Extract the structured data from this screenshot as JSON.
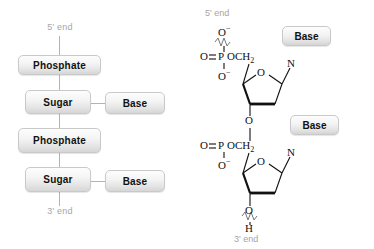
{
  "figure": {
    "background": "#ffffff",
    "box_border": "#c9c9c9",
    "line_color": "#b3b3b3",
    "bond_color": "#111111",
    "label_gray": "#a6a6a6"
  },
  "schematic": {
    "top_end_label": "5' end",
    "bottom_end_label": "3' end",
    "backbone": [
      {
        "label": "Phosphate"
      },
      {
        "label": "Sugar"
      },
      {
        "label": "Phosphate"
      },
      {
        "label": "Sugar"
      }
    ],
    "side_groups": [
      {
        "label": "Base"
      },
      {
        "label": "Base"
      }
    ]
  },
  "structure": {
    "top_end_label": "5' end",
    "bottom_end_label": "3' end",
    "nucleotide_1": {
      "base_label": "Base",
      "phosphate": {
        "o_minus_top": "O",
        "o_minus_top_charge": "−",
        "double_bond_o": "O",
        "p": "P",
        "och2": "OCH",
        "och2_sub": "2",
        "o_minus_bottom": "O",
        "o_minus_bottom_charge": "−"
      },
      "ring_oxygen": "O",
      "glycosidic_n": "N",
      "three_prime_o": "O"
    },
    "nucleotide_2": {
      "base_label": "Base",
      "phosphate": {
        "double_bond_o": "O",
        "p": "P",
        "och2": "OCH",
        "och2_sub": "2",
        "o_minus_bottom": "O",
        "o_minus_bottom_charge": "−"
      },
      "ring_oxygen": "O",
      "glycosidic_n": "N",
      "three_prime_o": "O",
      "hydroxyl_h": "H"
    }
  }
}
